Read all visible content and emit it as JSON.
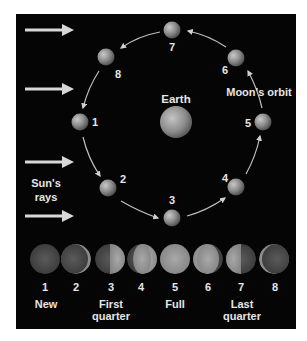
{
  "diagram": {
    "colors": {
      "background": "#050505",
      "text": "#e6e6e6",
      "arrow": "#d8d8d8",
      "page": "#ffffff"
    },
    "labels": {
      "earth": "Earth",
      "orbit": "Moon's orbit",
      "sun_line1": "Sun's",
      "sun_line2": "rays"
    },
    "sun_rays": {
      "count": 4,
      "direction": "left-to-right"
    },
    "orbit_positions": [
      {
        "n": "1",
        "x": 80,
        "y": 122
      },
      {
        "n": "2",
        "x": 108,
        "y": 188
      },
      {
        "n": "3",
        "x": 172,
        "y": 218
      },
      {
        "n": "4",
        "x": 236,
        "y": 187
      },
      {
        "n": "5",
        "x": 263,
        "y": 122
      },
      {
        "n": "6",
        "x": 236,
        "y": 58
      },
      {
        "n": "7",
        "x": 172,
        "y": 30
      },
      {
        "n": "8",
        "x": 106,
        "y": 57
      }
    ],
    "orbit_direction": "counter-clockwise",
    "phases": [
      {
        "n": "1",
        "name": "New"
      },
      {
        "n": "2",
        "name": ""
      },
      {
        "n": "3",
        "name": "First",
        "name2": "quarter"
      },
      {
        "n": "4",
        "name": ""
      },
      {
        "n": "5",
        "name": "Full"
      },
      {
        "n": "6",
        "name": ""
      },
      {
        "n": "7",
        "name": "Last",
        "name2": "quarter"
      },
      {
        "n": "8",
        "name": ""
      }
    ]
  }
}
